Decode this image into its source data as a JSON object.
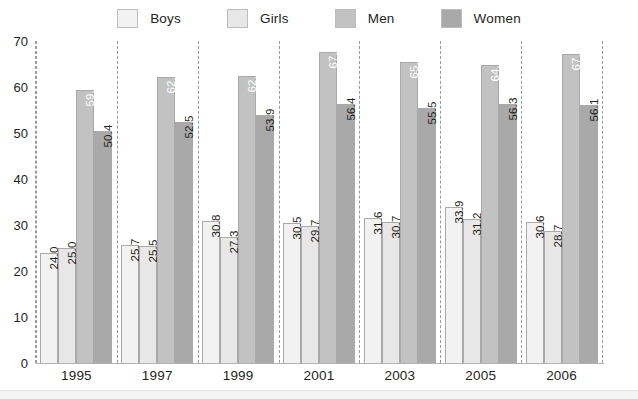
{
  "chart_data": {
    "type": "bar",
    "title": "",
    "xlabel": "",
    "ylabel": "",
    "ylim": [
      0,
      70
    ],
    "ytick_step": 10,
    "yticks": [
      "0",
      "10",
      "20",
      "30",
      "40",
      "50",
      "60",
      "70"
    ],
    "grid": false,
    "legend_position": "top-center",
    "categories": [
      "1995",
      "1997",
      "1999",
      "2001",
      "2003",
      "2005",
      "2006"
    ],
    "series": [
      {
        "name": "Boys",
        "color": "#f2f2f2",
        "label_color": "#231f20",
        "values": [
          24.0,
          25.7,
          30.8,
          30.5,
          31.6,
          33.9,
          30.6
        ],
        "labels": [
          "24.0",
          "25.7",
          "30.8",
          "30.5",
          "31.6",
          "33.9",
          "30.6"
        ]
      },
      {
        "name": "Girls",
        "color": "#e7e7e7",
        "label_color": "#231f20",
        "values": [
          25.0,
          25.5,
          27.3,
          29.7,
          30.7,
          31.2,
          28.7
        ],
        "labels": [
          "25.0",
          "25.5",
          "27.3",
          "29.7",
          "30.7",
          "31.2",
          "28.7"
        ]
      },
      {
        "name": "Men",
        "color": "#c2c2c2",
        "label_color": "#ffffff",
        "values": [
          59.3,
          62.2,
          62.5,
          67.7,
          65.4,
          64.7,
          67.1
        ],
        "labels": [
          "59.3",
          "62.2",
          "62.5",
          "67.7",
          "65.4",
          "64.7",
          "67.1"
        ]
      },
      {
        "name": "Women",
        "color": "#a9a9a9",
        "label_color": "#231f20",
        "values": [
          50.4,
          52.5,
          53.9,
          56.4,
          55.5,
          56.3,
          56.1
        ],
        "labels": [
          "50.4",
          "52.5",
          "53.9",
          "56.4",
          "55.5",
          "56.3",
          "56.1"
        ]
      }
    ]
  },
  "legend": {
    "items": [
      {
        "label": "Boys",
        "color": "#f2f2f2"
      },
      {
        "label": "Girls",
        "color": "#e7e7e7"
      },
      {
        "label": "Men",
        "color": "#c2c2c2"
      },
      {
        "label": "Women",
        "color": "#a9a9a9"
      }
    ]
  },
  "axis": {
    "y_tick_labels": [
      "70",
      "60",
      "50",
      "40",
      "30",
      "20",
      "10",
      "0"
    ],
    "x_tick_labels": [
      "1995",
      "1997",
      "1999",
      "2001",
      "2003",
      "2005",
      "2006"
    ]
  }
}
